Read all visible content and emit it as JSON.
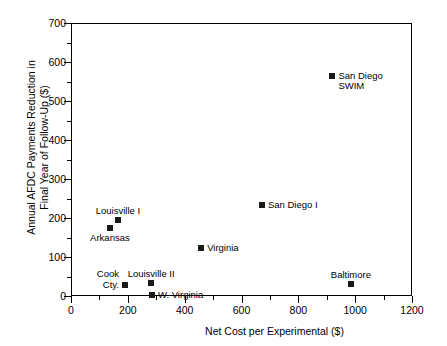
{
  "chart_data": {
    "type": "scatter",
    "title": "",
    "xlabel": "Net Cost per Experimental ($)",
    "ylabel_line1": "Annual AFDC Payments Reduction in",
    "ylabel_line2": "Final Year of Follow-Up ($)",
    "xlim": [
      0,
      1200
    ],
    "ylim": [
      0,
      700
    ],
    "xticks": [
      0,
      200,
      400,
      600,
      800,
      1000,
      1200
    ],
    "yticks": [
      0,
      100,
      200,
      300,
      400,
      500,
      600,
      700
    ],
    "xtick_labels": [
      "0",
      "200",
      "400",
      "600",
      "800",
      "1000",
      "1200"
    ],
    "ytick_labels": [
      "0",
      "100",
      "200",
      "300",
      "400",
      "500",
      "600",
      "700"
    ],
    "x_minor_interval": 100,
    "y_minor_interval": 50,
    "grid": false,
    "legend": "none",
    "marker_color": "#1a1a1a",
    "points": [
      {
        "label": "San Diego\nSWIM",
        "label_line1": "San Diego",
        "label_line2": "SWIM",
        "x": 920,
        "y": 565,
        "label_pos": "right"
      },
      {
        "label": "San Diego I",
        "label_line1": "San Diego I",
        "label_line2": "",
        "x": 672,
        "y": 233,
        "label_pos": "right"
      },
      {
        "label": "Louisville I",
        "label_line1": "Louisville I",
        "label_line2": "",
        "x": 165,
        "y": 195,
        "label_pos": "above"
      },
      {
        "label": "Arkansas",
        "label_line1": "Arkansas",
        "label_line2": "",
        "x": 137,
        "y": 175,
        "label_pos": "below"
      },
      {
        "label": "Virginia",
        "label_line1": "Virginia",
        "label_line2": "",
        "x": 458,
        "y": 123,
        "label_pos": "right"
      },
      {
        "label": "Cook\nCty.",
        "label_line1": "Cook",
        "label_line2": "Cty.",
        "x": 190,
        "y": 28,
        "label_pos": "left"
      },
      {
        "label": "Louisville II",
        "label_line1": "Louisville II",
        "label_line2": "",
        "x": 282,
        "y": 33,
        "label_pos": "above"
      },
      {
        "label": "W. Virginia",
        "label_line1": "W. Virginia",
        "label_line2": "",
        "x": 285,
        "y": 3,
        "label_pos": "right"
      },
      {
        "label": "Baltimore",
        "label_line1": "Baltimore",
        "label_line2": "",
        "x": 985,
        "y": 30,
        "label_pos": "above"
      }
    ]
  }
}
